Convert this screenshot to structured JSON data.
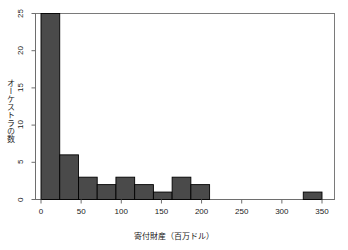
{
  "chart_data": {
    "type": "bar",
    "title": "",
    "subtitle": "",
    "xlabel": "寄付財産（百万ドル）",
    "ylabel": "オーケストラの数",
    "xlim": [
      0,
      350
    ],
    "ylim": [
      0,
      25
    ],
    "grid": false,
    "legend": null,
    "bin_width": 23.33,
    "bar_color": "#4a4a4a",
    "bar_edge_color": "#000000",
    "axis_color": "#6e6e6e",
    "categories": [
      "0–23",
      "23–47",
      "47–70",
      "70–93",
      "93–117",
      "117–140",
      "140–163",
      "163–187",
      "187–210",
      "210–233",
      "233–257",
      "257–280",
      "280–303",
      "303–327",
      "327–350"
    ],
    "bin_starts": [
      0,
      23.33,
      46.67,
      70,
      93.33,
      116.67,
      140,
      163.33,
      186.67,
      210,
      233.33,
      256.67,
      280,
      303.33,
      326.67
    ],
    "values": [
      25,
      6,
      3,
      2,
      3,
      2,
      1,
      3,
      2,
      0,
      0,
      0,
      0,
      0,
      1
    ],
    "xticks": [
      0,
      50,
      100,
      150,
      200,
      250,
      300,
      350
    ],
    "xtick_labels": [
      "0",
      "50",
      "100",
      "150",
      "200",
      "250",
      "300",
      "350"
    ],
    "yticks": [
      0,
      5,
      10,
      15,
      20,
      25
    ],
    "ytick_labels": [
      "0",
      "5",
      "10",
      "15",
      "20",
      "25"
    ],
    "annotations": []
  }
}
